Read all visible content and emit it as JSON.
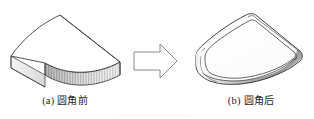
{
  "figure": {
    "width": 314,
    "height": 119,
    "background": "#ffffff",
    "kind": "cad-illustration",
    "topic": "fillet-operation-before-after"
  },
  "panels": [
    {
      "id": "a",
      "tag": "(a)",
      "label": "圆角前",
      "caption": "(a) 圆角前",
      "meaning": "before-fillet",
      "shape": "fan-shaped-wedge-block-sharp-edges"
    },
    {
      "id": "b",
      "tag": "(b)",
      "label": "圆角后",
      "caption": "(b) 圆角后",
      "meaning": "after-fillet",
      "shape": "fan-shaped-wedge-block-rounded-edges"
    }
  ],
  "arrow": {
    "direction": "right",
    "style": "outlined-block-arrow",
    "stroke": "#8a8a8a"
  },
  "colors": {
    "outline": "#3a3a3a",
    "outline_light": "#6e6e6e",
    "face_top": "#ffffff",
    "face_side_light": "#e9e9e9",
    "face_side_dark": "#8f8f8f",
    "caption": "#1d1d1f",
    "arrow_stroke": "#8a8a8a",
    "background": "#ffffff"
  }
}
